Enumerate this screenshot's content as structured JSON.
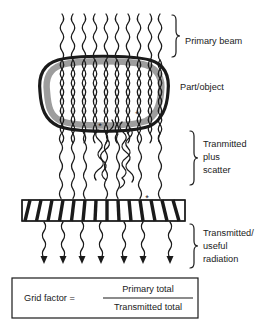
{
  "diagram": {
    "labels": {
      "primary_beam": "Primary beam",
      "part_object": "Part/object",
      "transmitted_plus_scatter_line1": "Tranmitted",
      "transmitted_plus_scatter_line2": "plus",
      "transmitted_plus_scatter_line3": "scatter",
      "transmitted_useful_line1": "Transmitted/",
      "transmitted_useful_line2": "useful",
      "transmitted_useful_line3": "radiation"
    },
    "formula": {
      "left_side": "Grid factor  =",
      "numerator": "Primary total",
      "denominator": "Transmitted total"
    },
    "scatter_markers": [
      "*",
      "*",
      "*",
      "*"
    ],
    "counts": {
      "primary_rays": 10,
      "transmitted_rays": 7,
      "grid_lamellae": 15
    },
    "colors": {
      "stroke": "#1a1a1a",
      "object_band": "#9d9d9d",
      "object_fill": "#ffffff",
      "background": "#ffffff"
    }
  }
}
